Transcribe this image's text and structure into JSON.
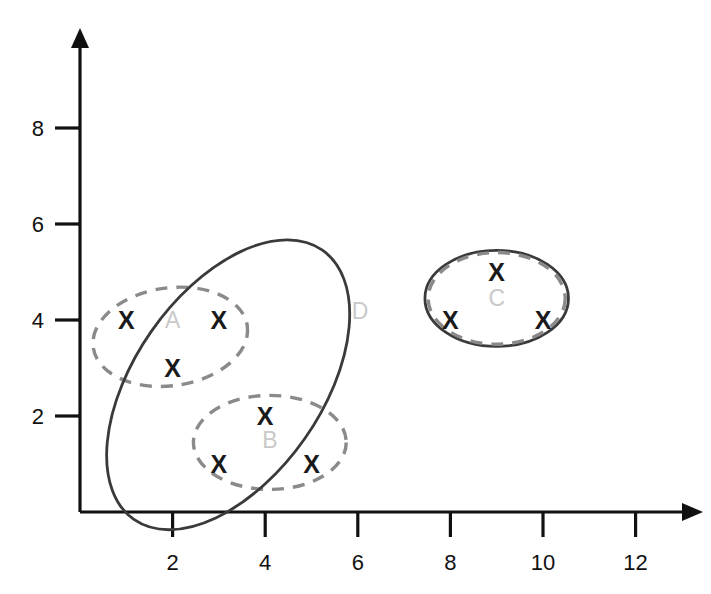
{
  "figure": {
    "title": "",
    "background_color": "#ffffff",
    "width": 711,
    "height": 594
  },
  "axes": {
    "x_tick_labels": [
      "2",
      "4",
      "6",
      "8",
      "10",
      "12"
    ],
    "x_tick_values": [
      2,
      4,
      6,
      8,
      10,
      12
    ],
    "y_tick_labels": [
      "2",
      "4",
      "6",
      "8"
    ],
    "y_tick_values": [
      2,
      4,
      6,
      8
    ],
    "x_label": "",
    "y_label": "",
    "axis_color": "#111111",
    "has_arrowheads": true
  },
  "chart_data": {
    "type": "scatter",
    "title": "",
    "xlabel": "",
    "ylabel": "",
    "xlim": [
      0,
      13.2
    ],
    "ylim": [
      0,
      9.6
    ],
    "grid": false,
    "legend": "none",
    "marker_symbol": "X",
    "marker_color": "#1a1a1a",
    "points": [
      {
        "x": 1,
        "y": 4,
        "cluster": "A"
      },
      {
        "x": 3,
        "y": 4,
        "cluster": "A"
      },
      {
        "x": 2,
        "y": 3,
        "cluster": "A"
      },
      {
        "x": 4,
        "y": 2,
        "cluster": "B"
      },
      {
        "x": 3,
        "y": 1,
        "cluster": "B"
      },
      {
        "x": 5,
        "y": 1,
        "cluster": "B"
      },
      {
        "x": 9,
        "y": 5,
        "cluster": "C"
      },
      {
        "x": 8,
        "y": 4,
        "cluster": "C"
      },
      {
        "x": 10,
        "y": 4,
        "cluster": "C"
      }
    ],
    "clusters": [
      {
        "label": "A",
        "style": "dashed",
        "stroke": "#8a8a8a",
        "label_color": "#c9c9c9",
        "label_x": 2.0,
        "label_y": 4.0,
        "center_x": 1.95,
        "center_y": 3.65,
        "radius_x": 1.68,
        "radius_y": 1.02,
        "rotation_deg": -8,
        "members": [
          "A1",
          "A2",
          "A3"
        ]
      },
      {
        "label": "B",
        "style": "dashed",
        "stroke": "#8a8a8a",
        "label_color": "#c9c9c9",
        "label_x": 4.1,
        "label_y": 1.5,
        "center_x": 4.1,
        "center_y": 1.45,
        "radius_x": 1.65,
        "radius_y": 0.98,
        "rotation_deg": 0,
        "members": [
          "B1",
          "B2",
          "B3"
        ]
      },
      {
        "label": "C",
        "style": "dashed-and-solid",
        "stroke": "#8a8a8a",
        "label_color": "#c9c9c9",
        "label_x": 9.0,
        "label_y": 4.45,
        "center_x": 9.0,
        "center_y": 4.45,
        "radius_x": 1.55,
        "radius_y": 1.0,
        "rotation_deg": 0,
        "members": [
          "C1",
          "C2",
          "C3"
        ]
      },
      {
        "label": "D",
        "style": "solid",
        "stroke": "#3a3a3a",
        "label_color": "#c9c9c9",
        "label_x": 6.05,
        "label_y": 4.18,
        "center_x": 3.2,
        "center_y": 2.65,
        "radius_x": 3.55,
        "radius_y": 1.95,
        "rotation_deg": -55,
        "members": [
          "A",
          "B"
        ]
      }
    ]
  }
}
